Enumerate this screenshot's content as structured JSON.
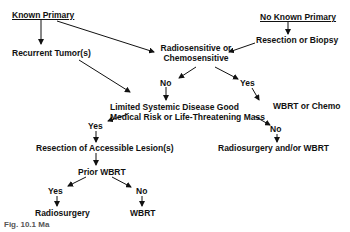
{
  "diagram": {
    "nodes": {
      "known_primary": "Known Primary",
      "no_known_primary": "No Known Primary",
      "resection_or_biopsy": "Resection or Biopsy",
      "recurrent_tumors": "Recurrent Tumor(s)",
      "radiosensitive_line1": "Radiosensitive or",
      "radiosensitive_line2": "Chemosensitive",
      "no_1": "No",
      "yes_1": "Yes",
      "wbrt_or_chemo": "WBRT or Chemo",
      "limited_line1": "Limited Systemic Disease Good",
      "limited_line2": "Medical Risk or Life-Threatening Mass",
      "yes_2": "Yes",
      "no_2": "No",
      "radiosurgery_and_or_wbrt": "Radiosurgery and/or WBRT",
      "resection_accessible": "Resection of Accessible Lesion(s)",
      "prior_wbrt": "Prior WBRT",
      "yes_3": "Yes",
      "no_3": "No",
      "radiosurgery": "Radiosurgery",
      "wbrt": "WBRT"
    },
    "caption": "Fig. 10.1 Ma"
  }
}
